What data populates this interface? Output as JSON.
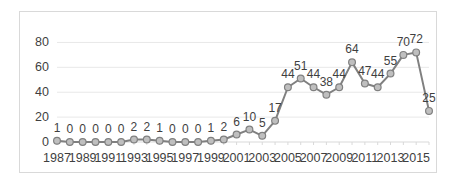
{
  "chart_data": {
    "type": "line",
    "title": "",
    "subtitle": "",
    "xlabel": "",
    "ylabel": "",
    "grid": "horizontal",
    "legend": "none",
    "ylim": [
      0,
      90
    ],
    "yticks": [
      "0",
      "20",
      "40",
      "60",
      "80"
    ],
    "ytick_values": [
      0,
      20,
      40,
      60,
      80
    ],
    "xtick_labels": [
      "1987",
      "1989",
      "1991",
      "1993",
      "1995",
      "1997",
      "1999",
      "2001",
      "2003",
      "2005",
      "2007",
      "2009",
      "2011",
      "2013",
      "2015"
    ],
    "x": [
      1987,
      1988,
      1989,
      1990,
      1991,
      1992,
      1993,
      1994,
      1995,
      1996,
      1997,
      1998,
      1999,
      2000,
      2001,
      2002,
      2003,
      2004,
      2005,
      2006,
      2007,
      2008,
      2009,
      2010,
      2011,
      2012,
      2013,
      2014,
      2015,
      2016
    ],
    "values": [
      1,
      0,
      0,
      0,
      0,
      0,
      2,
      2,
      1,
      0,
      0,
      0,
      1,
      2,
      6,
      10,
      5,
      17,
      44,
      51,
      44,
      38,
      44,
      64,
      47,
      44,
      55,
      70,
      72,
      25
    ],
    "data_labels": [
      "1",
      "0",
      "0",
      "0",
      "0",
      "0",
      "2",
      "2",
      "1",
      "0",
      "0",
      "0",
      "1",
      "2",
      "6",
      "10",
      "5",
      "17",
      "44",
      "51",
      "44",
      "38",
      "44",
      "64",
      "47",
      "44",
      "55",
      "70",
      "72",
      "25"
    ],
    "colors": {
      "line": "#808080",
      "marker_fill": "#bfbfbf",
      "marker_stroke": "#808080",
      "gridline": "#e8e8e8",
      "axis": "#d9d9d9",
      "text": "#3f3f3f",
      "frame": "#d9d9d9"
    }
  }
}
